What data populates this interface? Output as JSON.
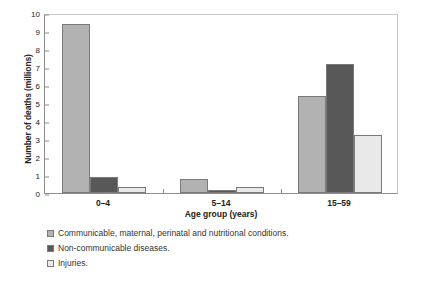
{
  "chart_data": {
    "type": "bar",
    "title": "",
    "subtitle": "",
    "xlabel": "Age group (years)",
    "ylabel": "Number of deaths (millions)",
    "categories": [
      "0–4",
      "5–14",
      "15–59"
    ],
    "ylim": [
      0,
      10
    ],
    "yticks": [
      0,
      1,
      2,
      3,
      4,
      5,
      6,
      7,
      8,
      9,
      10
    ],
    "ytick_labels": [
      "0",
      "1",
      "2",
      "3",
      "4",
      "5",
      "6",
      "7",
      "8",
      "9",
      "10"
    ],
    "grid": false,
    "legend_position": "below-left",
    "series": [
      {
        "name": "Communicable, maternal, perinatal and nutritional conditions.",
        "color": "#b2b2b2",
        "values": [
          9.4,
          0.77,
          5.4
        ]
      },
      {
        "name": "Non-communicable diseases.",
        "color": "#585858",
        "values": [
          0.9,
          0.17,
          7.15
        ]
      },
      {
        "name": "Injuries.",
        "color": "#e9e9e9",
        "values": [
          0.33,
          0.32,
          3.22
        ]
      }
    ]
  },
  "axes": {
    "y_title": "Number of deaths (millions)",
    "x_title": "Age group (years)"
  },
  "legend": {
    "items": [
      {
        "label": "Communicable, maternal, perinatal and nutritional conditions.",
        "color": "#b2b2b2"
      },
      {
        "label": "Non-communicable diseases.",
        "color": "#585858"
      },
      {
        "label": "Injuries.",
        "color": "#e9e9e9"
      }
    ]
  },
  "colors": {
    "communicable": "#b2b2b2",
    "non_communicable": "#585858",
    "injuries": "#e9e9e9",
    "axis": "#8d8d8d",
    "frame": "#c9c9c9",
    "bar_outline": "#7a7a7a",
    "background": "#ffffff"
  }
}
